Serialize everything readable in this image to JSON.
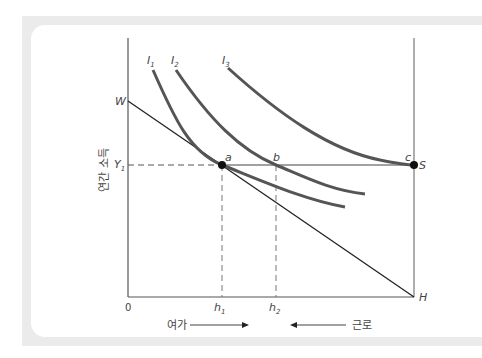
{
  "diagram": {
    "type": "labor-leisure indifference curve diagram",
    "y_axis_label": "연간 소득",
    "origin_label": "0",
    "axis_points": {
      "W": "W",
      "H": "H",
      "S": "S",
      "Y1": "Y",
      "Y1_sub": "1"
    },
    "curves": [
      {
        "label": "I",
        "sub": "1"
      },
      {
        "label": "I",
        "sub": "2"
      },
      {
        "label": "I",
        "sub": "3"
      }
    ],
    "points": {
      "a": "a",
      "b": "b",
      "c": "c"
    },
    "x_ticks": [
      {
        "label": "h",
        "sub": "1"
      },
      {
        "label": "h",
        "sub": "2"
      }
    ],
    "bottom_labels": {
      "leisure": "여가",
      "work": "근로"
    },
    "colors": {
      "curve": "#555555",
      "axis": "#444444",
      "budget_line": "#222222",
      "frame": "#ebebeb",
      "point": "#111111"
    }
  }
}
